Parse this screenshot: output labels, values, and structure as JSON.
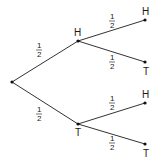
{
  "diagram": {
    "type": "probability-tree",
    "colors": {
      "edge": "#333333",
      "node": "#111111",
      "text": "#1a1a1a",
      "background": "#ffffff"
    },
    "nodes": {
      "root": {
        "x": 12,
        "y": 82
      },
      "mid_h": {
        "x": 78,
        "y": 41,
        "label": "H"
      },
      "mid_t": {
        "x": 78,
        "y": 124,
        "label": "T"
      },
      "leaf_hh": {
        "x": 145,
        "y": 20,
        "label": "H"
      },
      "leaf_ht": {
        "x": 145,
        "y": 62,
        "label": "T"
      },
      "leaf_th": {
        "x": 145,
        "y": 103,
        "label": "H"
      },
      "leaf_tt": {
        "x": 145,
        "y": 144,
        "label": "T"
      }
    },
    "edges": [
      {
        "from": "root",
        "to": "mid_h",
        "probability": {
          "numerator": "1",
          "denominator": "2"
        }
      },
      {
        "from": "root",
        "to": "mid_t",
        "probability": {
          "numerator": "1",
          "denominator": "2"
        }
      },
      {
        "from": "mid_h",
        "to": "leaf_hh",
        "probability": {
          "numerator": "1",
          "denominator": "2"
        }
      },
      {
        "from": "mid_h",
        "to": "leaf_ht",
        "probability": {
          "numerator": "1",
          "denominator": "2"
        }
      },
      {
        "from": "mid_t",
        "to": "leaf_th",
        "probability": {
          "numerator": "1",
          "denominator": "2"
        }
      },
      {
        "from": "mid_t",
        "to": "leaf_tt",
        "probability": {
          "numerator": "1",
          "denominator": "2"
        }
      }
    ]
  }
}
